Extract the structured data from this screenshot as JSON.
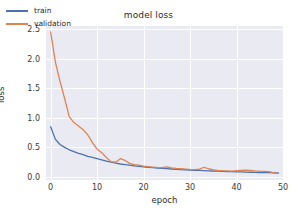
{
  "chart_data": {
    "type": "line",
    "title": "model loss",
    "xlabel": "epoch",
    "ylabel": "loss",
    "xlim": [
      -1,
      50
    ],
    "ylim": [
      -0.05,
      2.55
    ],
    "xticks": [
      "0",
      "10",
      "20",
      "30",
      "40",
      "50"
    ],
    "xtick_values": [
      0,
      10,
      20,
      30,
      40,
      50
    ],
    "yticks": [
      "0.0",
      "0.5",
      "1.0",
      "1.5",
      "2.0",
      "2.5"
    ],
    "ytick_values": [
      0.0,
      0.5,
      1.0,
      1.5,
      2.0,
      2.5
    ],
    "grid": true,
    "legend_position": "upper left",
    "x": [
      0,
      1,
      2,
      3,
      4,
      5,
      6,
      7,
      8,
      9,
      10,
      11,
      12,
      13,
      14,
      15,
      16,
      17,
      18,
      19,
      20,
      21,
      22,
      23,
      24,
      25,
      26,
      27,
      28,
      29,
      30,
      31,
      32,
      33,
      34,
      35,
      36,
      37,
      38,
      39,
      40,
      41,
      42,
      43,
      44,
      45,
      46,
      47,
      48,
      49
    ],
    "series": [
      {
        "name": "train",
        "color": "#4c72b0",
        "values": [
          0.85,
          0.64,
          0.55,
          0.5,
          0.46,
          0.43,
          0.4,
          0.38,
          0.35,
          0.33,
          0.31,
          0.29,
          0.27,
          0.25,
          0.235,
          0.22,
          0.21,
          0.2,
          0.19,
          0.18,
          0.172,
          0.165,
          0.158,
          0.152,
          0.146,
          0.141,
          0.136,
          0.131,
          0.127,
          0.123,
          0.119,
          0.115,
          0.112,
          0.108,
          0.105,
          0.102,
          0.099,
          0.096,
          0.093,
          0.091,
          0.088,
          0.086,
          0.083,
          0.081,
          0.079,
          0.077,
          0.075,
          0.073,
          0.071,
          0.069
        ]
      },
      {
        "name": "validation",
        "color": "#dd8452",
        "values": [
          2.45,
          1.95,
          1.62,
          1.33,
          1.02,
          0.92,
          0.86,
          0.8,
          0.71,
          0.58,
          0.47,
          0.41,
          0.33,
          0.26,
          0.25,
          0.31,
          0.28,
          0.23,
          0.21,
          0.2,
          0.185,
          0.175,
          0.168,
          0.162,
          0.158,
          0.172,
          0.155,
          0.145,
          0.14,
          0.134,
          0.128,
          0.124,
          0.133,
          0.165,
          0.14,
          0.122,
          0.112,
          0.107,
          0.104,
          0.101,
          0.106,
          0.112,
          0.118,
          0.113,
          0.105,
          0.1,
          0.097,
          0.092,
          0.07,
          0.062
        ]
      }
    ]
  },
  "legend": {
    "entries": [
      {
        "label": "train"
      },
      {
        "label": "validation"
      }
    ]
  }
}
